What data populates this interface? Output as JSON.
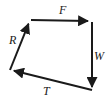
{
  "diagram": {
    "type": "vector-diagram",
    "shape": "closed-quadrilateral-loop",
    "stroke_color": "#1a1a1a",
    "background_color": "#ffffff",
    "stroke_width": 2,
    "vertices": [
      {
        "name": "top-left",
        "x": 30,
        "y": 20
      },
      {
        "name": "top-right",
        "x": 92,
        "y": 21
      },
      {
        "name": "bottom-right",
        "x": 92,
        "y": 91
      },
      {
        "name": "bottom-left",
        "x": 10,
        "y": 70
      }
    ],
    "vectors": [
      {
        "label": "F",
        "name": "vector-f",
        "direction": "right",
        "from": {
          "x": 31,
          "y": 20
        },
        "to": {
          "x": 92,
          "y": 21
        },
        "label_x": 59,
        "label_y": 4
      },
      {
        "label": "W",
        "name": "vector-w",
        "direction": "down",
        "from": {
          "x": 92,
          "y": 22
        },
        "to": {
          "x": 92,
          "y": 91
        },
        "label_x": 94,
        "label_y": 50
      },
      {
        "label": "T",
        "name": "vector-t",
        "direction": "left",
        "from": {
          "x": 92,
          "y": 90
        },
        "to": {
          "x": 10,
          "y": 70
        },
        "label_x": 43,
        "label_y": 85
      },
      {
        "label": "R",
        "name": "vector-r",
        "direction": "up-right",
        "from": {
          "x": 10,
          "y": 70
        },
        "to": {
          "x": 30,
          "y": 20
        },
        "label_x": 9,
        "label_y": 34
      }
    ]
  }
}
